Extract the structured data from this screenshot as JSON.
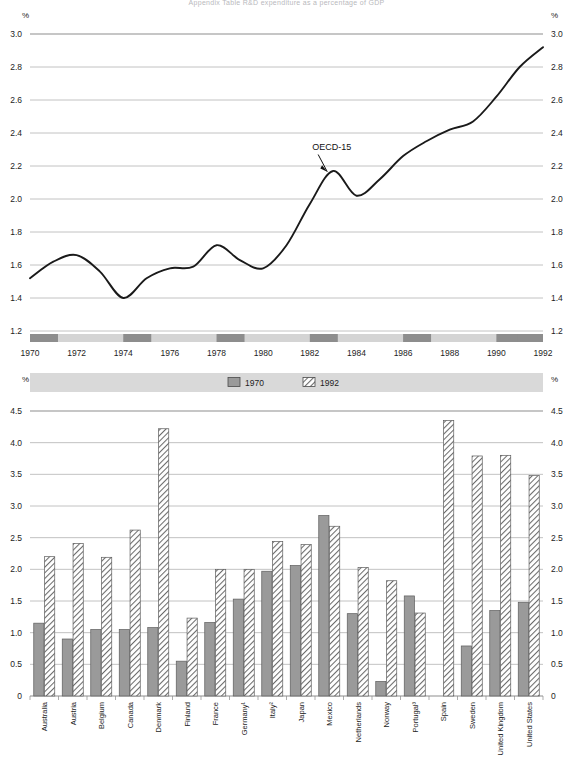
{
  "page": {
    "title_top": "Appendix Table  R&D expenditure as a percentage of GDP",
    "unit_symbol": "%"
  },
  "chart_data": [
    {
      "type": "line",
      "id": "oecd-total-line",
      "title": "",
      "xlabel": "",
      "ylabel": "%",
      "xlim": [
        1970,
        1992
      ],
      "ylim": [
        1.2,
        3.0
      ],
      "yticks": [
        "3.0",
        "2.8",
        "2.6",
        "2.4",
        "2.2",
        "2.0",
        "1.8",
        "1.6",
        "1.4",
        "1.2"
      ],
      "xticks": [
        "1970",
        "1972",
        "1974",
        "1976",
        "1978",
        "1980",
        "1982",
        "1984",
        "1986",
        "1988",
        "1990",
        "1992"
      ],
      "grid": true,
      "legend_position": "none",
      "annotations": [
        {
          "text": "OECD-15",
          "x": 1982.1,
          "y": 2.3
        }
      ],
      "series": [
        {
          "name": "OECD-15",
          "x": [
            1970,
            1971,
            1972,
            1973,
            1974,
            1975,
            1976,
            1977,
            1978,
            1979,
            1980,
            1981,
            1982,
            1983,
            1984,
            1985,
            1986,
            1987,
            1988,
            1989,
            1990,
            1991,
            1992
          ],
          "values": [
            1.52,
            1.62,
            1.66,
            1.56,
            1.4,
            1.52,
            1.58,
            1.59,
            1.72,
            1.63,
            1.58,
            1.72,
            1.97,
            2.17,
            2.02,
            2.12,
            2.26,
            2.35,
            2.42,
            2.47,
            2.62,
            2.8,
            2.92
          ]
        }
      ]
    },
    {
      "type": "bar",
      "id": "country-rd-bars",
      "title": "",
      "xlabel": "",
      "ylabel": "%",
      "ylim": [
        0,
        4.5
      ],
      "yticks": [
        "4.5",
        "4.0",
        "3.5",
        "3.0",
        "2.5",
        "2.0",
        "1.5",
        "1.0",
        "0.5",
        "0"
      ],
      "grid": true,
      "legend_position": "top-center",
      "categories": [
        "Australia",
        "Austria",
        "Belgium",
        "Canada",
        "Denmark",
        "Finland",
        "France",
        "Germany¹",
        "Italy²",
        "Japan",
        "Mexico",
        "Netherlands",
        "Norway",
        "Portugal³",
        "Spain",
        "Sweden",
        "United Kingdom",
        "United States"
      ],
      "series": [
        {
          "name": "1970",
          "values": [
            1.15,
            0.9,
            1.05,
            1.05,
            1.08,
            0.55,
            1.16,
            1.53,
            1.97,
            2.06,
            2.85,
            1.3,
            0.23,
            1.58,
            0.0,
            0.79,
            1.35,
            1.48
          ]
        },
        {
          "name": "1992",
          "values": [
            2.2,
            2.41,
            2.19,
            2.62,
            4.22,
            1.23,
            2.0,
            2.0,
            2.44,
            2.39,
            2.68,
            2.03,
            1.82,
            1.31,
            4.35,
            3.79,
            3.8,
            3.48
          ]
        }
      ]
    }
  ],
  "top_chart": {
    "unit_left": "%",
    "unit_right": "%",
    "annotation": "OECD-15",
    "ylabels": [
      "3.0",
      "2.8",
      "2.6",
      "2.4",
      "2.2",
      "2.0",
      "1.8",
      "1.6",
      "1.4",
      "1.2"
    ],
    "xlabels": [
      "1970",
      "1972",
      "1974",
      "1976",
      "1978",
      "1980",
      "1982",
      "1984",
      "1986",
      "1988",
      "1990",
      "1992"
    ]
  },
  "bottom_chart": {
    "unit_left": "%",
    "unit_right": "%",
    "ylabels": [
      "4.5",
      "4.0",
      "3.5",
      "3.0",
      "2.5",
      "2.0",
      "1.5",
      "1.0",
      "0.5",
      "0"
    ],
    "legend": [
      {
        "label": "1970",
        "style": "solid",
        "color": "#9a9a9a"
      },
      {
        "label": "1992",
        "style": "hatch",
        "color": "#ffffff"
      }
    ]
  },
  "colors": {
    "line": "#1a1a1a",
    "grid": "#b3b3b3",
    "bar_1970": "#9a9a9a",
    "bar_1992_hatch": "#6b6b6b",
    "band_dark": "#8d8d8d",
    "band_light": "#d4d4d4",
    "legend_band": "#d9d9d9"
  }
}
